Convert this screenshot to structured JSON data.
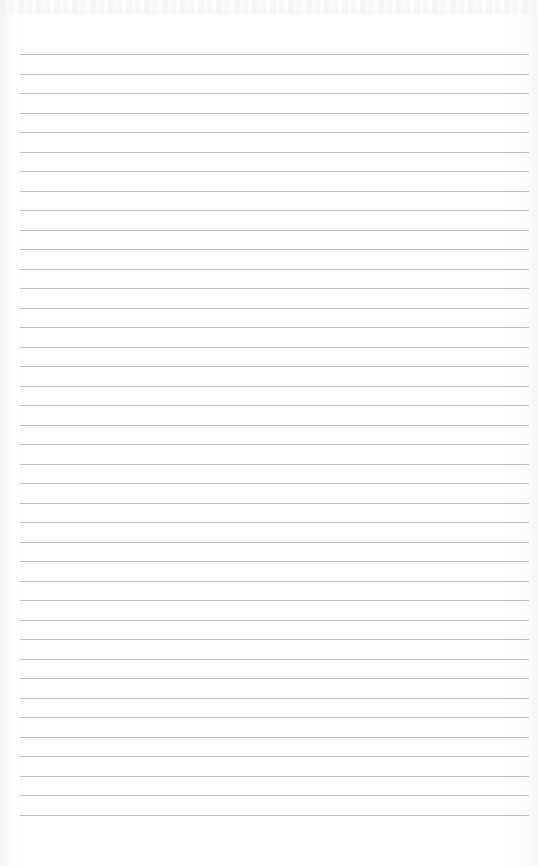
{
  "page": {
    "type": "lined-paper",
    "line_count": 40,
    "first_line_y": 54,
    "line_spacing": 19.5,
    "line_left": 20,
    "line_right": 529,
    "colors": {
      "paper": "#ffffff",
      "rule": "#bdbdbd",
      "edge_shadow": "#f4f4f4"
    },
    "content_text": ""
  }
}
